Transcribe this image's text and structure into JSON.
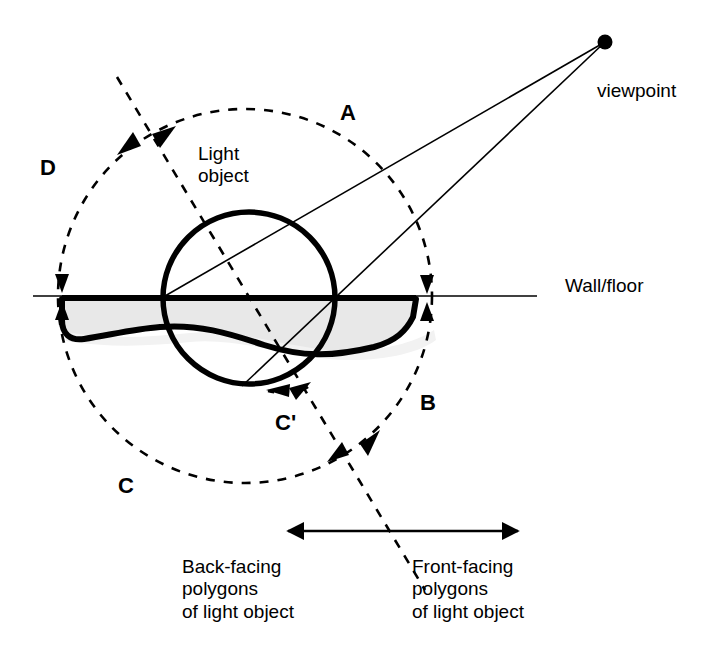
{
  "figure": {
    "type": "technical-line-diagram",
    "topic": "Shadow volume / light object regions relative to a viewpoint",
    "background_color": "#ffffff",
    "ink_color": "#000000",
    "fill_color": "#e8e8e8"
  },
  "labels": {
    "region_a": "A",
    "region_b": "B",
    "region_c": "C",
    "region_c_prime": "C'",
    "region_d": "D",
    "viewpoint": "viewpoint",
    "wall_floor": "Wall/floor",
    "light_object": "Light\nobject",
    "back_facing": "Back-facing\npolygons\nof light object",
    "front_facing": "Front-facing\npolygons\nof light object"
  },
  "geometry": {
    "viewpoint_dot": {
      "cx": 605,
      "cy": 42,
      "r": 7
    },
    "dashed_circle": {
      "cx": 245,
      "cy": 296,
      "r": 187
    },
    "solid_circle": {
      "cx": 249,
      "cy": 298,
      "r": 86
    },
    "wall_floor_line": {
      "x1": 33,
      "y1": 296,
      "x2": 537,
      "y2": 296
    },
    "dashed_cut_line": {
      "x1": 117,
      "y1": 77,
      "x2": 425,
      "y2": 590
    },
    "sight_line_upper": {
      "x1": 605,
      "y1": 42,
      "x2": 165,
      "y2": 296
    },
    "sight_line_lower": {
      "x1": 605,
      "y1": 42,
      "x2": 242,
      "y2": 386
    },
    "span_arrow": {
      "x1": 288,
      "y1": 531,
      "x2": 518,
      "y2": 531
    }
  },
  "label_positions": {
    "region_a": {
      "left": 340,
      "top": 100
    },
    "region_b": {
      "left": 420,
      "top": 390
    },
    "region_c": {
      "left": 118,
      "top": 473
    },
    "region_c_prime": {
      "left": 275,
      "top": 410
    },
    "region_d": {
      "left": 40,
      "top": 155
    },
    "viewpoint": {
      "left": 597,
      "top": 80
    },
    "wall_floor": {
      "left": 565,
      "top": 275
    },
    "light_object": {
      "left": 198,
      "top": 143
    },
    "back_facing": {
      "left": 182,
      "top": 556
    },
    "front_facing": {
      "left": 412,
      "top": 556
    }
  },
  "annotation_markers": [
    {
      "name": "marker-d-a-boundary",
      "x": 147,
      "y": 140,
      "description": "arrow pair at dashed-circle / dashed-line crossing, upper left"
    },
    {
      "name": "marker-d-c-boundary",
      "x": 62,
      "y": 296,
      "description": "arrow pair at dashed-circle / wall-floor crossing, left"
    },
    {
      "name": "marker-a-b-boundary",
      "x": 427,
      "y": 297,
      "description": "arrow pair at dashed-circle / wall-floor crossing, right"
    },
    {
      "name": "marker-b-c-boundary",
      "x": 355,
      "y": 450,
      "description": "arrow pair at dashed-circle / dashed-line crossing, lower right"
    },
    {
      "name": "marker-c-prime-boundary",
      "x": 290,
      "y": 387,
      "description": "arrow pair on solid-circle bottom near C-prime"
    }
  ]
}
